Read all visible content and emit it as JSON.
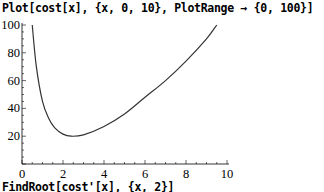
{
  "notebook": {
    "input_1": "Plot[cost[x], {x, 0, 10}, PlotRange → {0, 100}]",
    "input_2": "FindRoot[cost'[x], {x, 2}]"
  },
  "chart_data": {
    "type": "line",
    "title": "",
    "xlabel": "",
    "ylabel": "",
    "xlim": [
      0,
      10
    ],
    "ylim": [
      0,
      100
    ],
    "grid": false,
    "x_ticks": [
      0,
      2,
      4,
      6,
      8,
      10
    ],
    "y_ticks": [
      20,
      40,
      60,
      80,
      100
    ],
    "series": [
      {
        "name": "cost[x]",
        "x": [
          0.5,
          0.7,
          1.0,
          1.3,
          1.6,
          2.0,
          2.4,
          3.0,
          4.0,
          5.0,
          6.0,
          7.0,
          8.0,
          9.0,
          9.5
        ],
        "y": [
          100,
          70,
          45,
          33,
          26,
          21.5,
          20,
          21,
          27,
          36,
          48,
          60,
          74,
          90,
          100
        ]
      }
    ],
    "colors": {
      "curve": "#333333",
      "axis": "#000000"
    }
  }
}
